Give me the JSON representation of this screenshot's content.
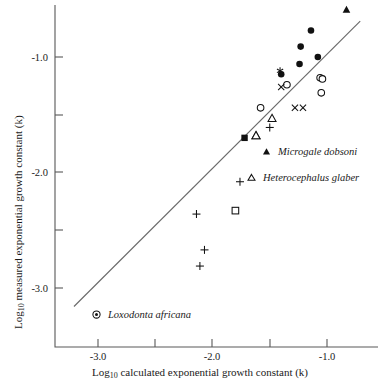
{
  "chart_data": {
    "type": "scatter",
    "title": "",
    "xlabel": "Log10 calculated exponential growth constant (k)",
    "ylabel": "Log10 measured exponential growth constant (k)",
    "xlabel_base": "Log",
    "xlabel_sub": "10",
    "xlabel_rest": " calculated exponential growth constant (k)",
    "ylabel_base": "Log",
    "ylabel_sub": "10",
    "ylabel_rest": " measured exponential growth constant (k)",
    "xlim": [
      -3.42,
      -0.52
    ],
    "ylim": [
      -3.45,
      -0.54
    ],
    "grid": false,
    "x_ticks": [
      -3.0,
      -2.5,
      -2.0,
      -1.5,
      -1.0
    ],
    "x_tick_labels": [
      "-3.0",
      "",
      "-2.0",
      "",
      "-1.0"
    ],
    "y_ticks": [
      -1.0,
      -1.5,
      -2.0,
      -2.5,
      -3.0
    ],
    "y_tick_labels": [
      "-1.0",
      "",
      "-2.0",
      "",
      "-3.0"
    ],
    "fit_line": {
      "name": "regression line",
      "x_start": -3.21,
      "y_start": -3.16,
      "x_end": -0.71,
      "y_end": -0.69
    },
    "series": [
      {
        "name": "filled-circle",
        "marker": "filled-circle",
        "points": [
          {
            "x": -1.14,
            "y": -0.77
          },
          {
            "x": -1.23,
            "y": -0.91
          },
          {
            "x": -1.08,
            "y": -1.0
          },
          {
            "x": -1.24,
            "y": -1.06
          },
          {
            "x": -1.4,
            "y": -1.15
          }
        ]
      },
      {
        "name": "open-circle",
        "marker": "open-circle",
        "points": [
          {
            "x": -1.06,
            "y": -1.18
          },
          {
            "x": -1.04,
            "y": -1.19
          },
          {
            "x": -1.05,
            "y": -1.31
          },
          {
            "x": -1.35,
            "y": -1.24
          },
          {
            "x": -1.58,
            "y": -1.44
          }
        ]
      },
      {
        "name": "x-mark",
        "marker": "x",
        "points": [
          {
            "x": -1.4,
            "y": -1.26
          },
          {
            "x": -1.28,
            "y": -1.44
          },
          {
            "x": -1.21,
            "y": -1.44
          }
        ]
      },
      {
        "name": "asterisk",
        "marker": "asterisk",
        "points": [
          {
            "x": -1.41,
            "y": -1.12
          }
        ]
      },
      {
        "name": "plus",
        "marker": "plus",
        "points": [
          {
            "x": -1.5,
            "y": -1.61
          },
          {
            "x": -1.76,
            "y": -2.08
          },
          {
            "x": -2.14,
            "y": -2.36
          },
          {
            "x": -2.07,
            "y": -2.67
          },
          {
            "x": -2.11,
            "y": -2.81
          }
        ]
      },
      {
        "name": "filled-square",
        "marker": "filled-square",
        "points": [
          {
            "x": -1.72,
            "y": -1.7
          }
        ]
      },
      {
        "name": "open-square",
        "marker": "open-square",
        "points": [
          {
            "x": -1.8,
            "y": -2.33
          }
        ]
      },
      {
        "name": "open-triangle",
        "marker": "open-triangle",
        "points": [
          {
            "x": -1.62,
            "y": -1.68
          },
          {
            "x": -1.48,
            "y": -1.53
          },
          {
            "x": -1.62,
            "y": -1.68
          }
        ]
      },
      {
        "name": "filled-triangle",
        "marker": "filled-triangle",
        "points": [
          {
            "x": -0.83,
            "y": -0.59
          }
        ]
      }
    ],
    "annotations": [
      {
        "name": "legend-microgale",
        "marker": "filled-triangle",
        "label": "Microgale dobsoni"
      },
      {
        "name": "legend-heterocephalus",
        "marker": "open-triangle",
        "label": "Heterocephalus glaber"
      },
      {
        "name": "legend-loxodonta",
        "marker": "circled-dot",
        "label": "Loxodonta africana"
      }
    ]
  },
  "legend": {
    "microgale": "Microgale dobsoni",
    "heterocephalus": "Heterocephalus glaber",
    "loxodonta": "Loxodonta africana"
  }
}
